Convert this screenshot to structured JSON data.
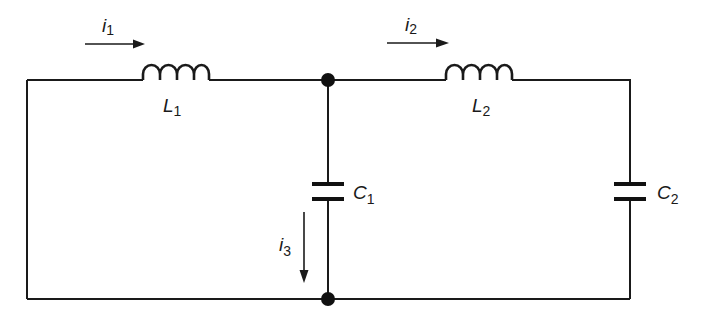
{
  "diagram": {
    "type": "circuit-schematic",
    "colors": {
      "ink": "#1a1a1a",
      "background": "#ffffff"
    },
    "components": {
      "L1": {
        "symbol": "L",
        "subscript": "1",
        "kind": "inductor"
      },
      "L2": {
        "symbol": "L",
        "subscript": "2",
        "kind": "inductor"
      },
      "C1": {
        "symbol": "C",
        "subscript": "1",
        "kind": "capacitor"
      },
      "C2": {
        "symbol": "C",
        "subscript": "2",
        "kind": "capacitor"
      }
    },
    "currents": {
      "i1": {
        "symbol": "i",
        "subscript": "1",
        "direction": "right"
      },
      "i2": {
        "symbol": "i",
        "subscript": "2",
        "direction": "right"
      },
      "i3": {
        "symbol": "i",
        "subscript": "3",
        "direction": "down"
      }
    },
    "nodes": [
      "top-junction",
      "bottom-junction"
    ]
  }
}
